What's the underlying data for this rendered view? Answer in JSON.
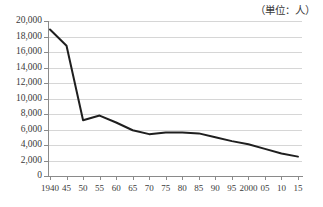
{
  "chart_data": {
    "type": "line",
    "title": "（単位：人）",
    "xlabel": "",
    "ylabel": "",
    "categories": [
      "1940",
      "45",
      "50",
      "55",
      "60",
      "65",
      "70",
      "75",
      "80",
      "85",
      "90",
      "95",
      "2000",
      "05",
      "10",
      "15"
    ],
    "values": [
      18900,
      16800,
      7200,
      7800,
      6900,
      5900,
      5400,
      5600,
      5600,
      5500,
      5000,
      4500,
      4100,
      3500,
      2900,
      2500
    ],
    "series": [
      {
        "name": "人口",
        "values": [
          18900,
          16800,
          7200,
          7800,
          6900,
          5900,
          5400,
          5600,
          5600,
          5500,
          5000,
          4500,
          4100,
          3500,
          2900,
          2500
        ]
      }
    ],
    "ylim": [
      0,
      20000
    ],
    "ytick_step": 2000,
    "yticks": [
      "20,000",
      "18,000",
      "16,000",
      "14,000",
      "12,000",
      "10,000",
      "8,000",
      "6,000",
      "4,000",
      "2,000",
      "0"
    ],
    "ytick_values": [
      20000,
      18000,
      16000,
      14000,
      12000,
      10000,
      8000,
      6000,
      4000,
      2000,
      0
    ],
    "grid": true,
    "legend": "none",
    "line_color": "#1f1f1f",
    "grid_color": "#d6d6d6",
    "axis_color": "#8a8a8a",
    "background": "#ffffff"
  }
}
